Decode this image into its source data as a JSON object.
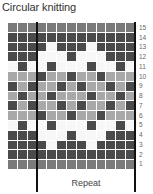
{
  "title": "Circular knitting",
  "repeat_label": "Repeat",
  "colors": {
    "D": "#4a4a4a",
    "M": "#7a7a7a",
    "L": "#a8a8a8",
    "W": "#f7f7f7",
    "line": "#111111"
  },
  "grid": {
    "columns": 13,
    "repeat_columns": [
      3,
      12
    ],
    "rows": [
      {
        "label": "15",
        "cells": [
          "M",
          "M",
          "M",
          "M",
          "M",
          "M",
          "M",
          "M",
          "M",
          "M",
          "M",
          "M",
          "M"
        ]
      },
      {
        "label": "14",
        "cells": [
          "D",
          "D",
          "D",
          "D",
          "D",
          "D",
          "D",
          "D",
          "D",
          "D",
          "D",
          "D",
          "D"
        ]
      },
      {
        "label": "13",
        "cells": [
          "D",
          "D",
          "D",
          "D",
          "W",
          "D",
          "D",
          "D",
          "W",
          "D",
          "D",
          "D",
          "D"
        ]
      },
      {
        "label": "12",
        "cells": [
          "D",
          "D",
          "D",
          "W",
          "W",
          "W",
          "D",
          "W",
          "W",
          "W",
          "D",
          "D",
          "D"
        ]
      },
      {
        "label": "11",
        "cells": [
          "W",
          "D",
          "W",
          "W",
          "D",
          "W",
          "W",
          "W",
          "D",
          "W",
          "W",
          "D",
          "W"
        ]
      },
      {
        "label": "10",
        "cells": [
          "L",
          "L",
          "L",
          "D",
          "L",
          "L",
          "D",
          "L",
          "L",
          "D",
          "L",
          "L",
          "L"
        ]
      },
      {
        "label": "9",
        "cells": [
          "D",
          "L",
          "D",
          "L",
          "L",
          "D",
          "L",
          "D",
          "L",
          "L",
          "D",
          "L",
          "D"
        ]
      },
      {
        "label": "8",
        "cells": [
          "L",
          "D",
          "L",
          "L",
          "D",
          "L",
          "L",
          "L",
          "D",
          "L",
          "L",
          "D",
          "L"
        ]
      },
      {
        "label": "7",
        "cells": [
          "D",
          "L",
          "D",
          "L",
          "L",
          "D",
          "L",
          "D",
          "L",
          "L",
          "D",
          "L",
          "D"
        ]
      },
      {
        "label": "6",
        "cells": [
          "L",
          "L",
          "L",
          "D",
          "L",
          "L",
          "D",
          "L",
          "L",
          "D",
          "L",
          "L",
          "L"
        ]
      },
      {
        "label": "5",
        "cells": [
          "W",
          "D",
          "W",
          "W",
          "D",
          "W",
          "W",
          "W",
          "D",
          "W",
          "W",
          "D",
          "W"
        ]
      },
      {
        "label": "4",
        "cells": [
          "D",
          "D",
          "D",
          "W",
          "W",
          "W",
          "D",
          "W",
          "W",
          "W",
          "D",
          "D",
          "D"
        ]
      },
      {
        "label": "3",
        "cells": [
          "D",
          "D",
          "D",
          "D",
          "W",
          "D",
          "D",
          "D",
          "W",
          "D",
          "D",
          "D",
          "D"
        ]
      },
      {
        "label": "2",
        "cells": [
          "D",
          "D",
          "D",
          "D",
          "D",
          "D",
          "D",
          "D",
          "D",
          "D",
          "D",
          "D",
          "D"
        ]
      },
      {
        "label": "1",
        "cells": [
          "M",
          "M",
          "M",
          "M",
          "M",
          "M",
          "M",
          "M",
          "M",
          "M",
          "M",
          "M",
          "M"
        ]
      }
    ]
  }
}
